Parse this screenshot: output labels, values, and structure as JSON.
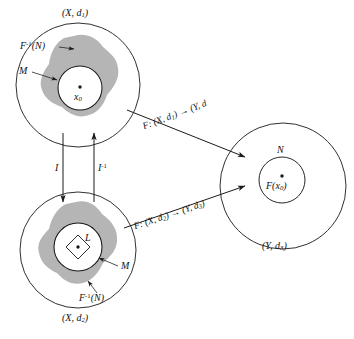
{
  "figure": {
    "colors": {
      "stroke": "#1a1a1a",
      "blob_fill": "#b5b5b5",
      "background": "#ffffff"
    }
  },
  "top_space": {
    "outer_label": "(X, d₁)",
    "outer_label_parts": {
      "base": "(X, d",
      "sub": "1",
      "close": ")"
    },
    "preimage_label": "F⁻¹(N)",
    "preimage_label_parts": {
      "base": "F",
      "sup": "-1",
      "close": "(N)"
    },
    "inner_set_label": "M",
    "point_label": "x₀",
    "point_label_parts": {
      "base": "x",
      "sub": "0"
    }
  },
  "bottom_space": {
    "outer_label": "(X, d₂)",
    "outer_label_parts": {
      "base": "(X, d",
      "sub": "2",
      "close": ")"
    },
    "preimage_label": "F⁻¹(N)",
    "preimage_label_parts": {
      "base": "F",
      "sup": "-1",
      "close": "(N)"
    },
    "inner_set_label": "M",
    "diamond_label": "L"
  },
  "target_space": {
    "outer_label": "(Y, d₃)",
    "outer_label_parts": {
      "base": "(Y, d",
      "sub": "3",
      "close": ")"
    },
    "inner_set_label": "N",
    "point_label": "F(x₀)",
    "point_label_parts": {
      "base": "F(x",
      "sub": "0",
      "close": ")"
    }
  },
  "maps": {
    "top_map": "F: (X, d₁) → (Y, d₃)",
    "top_map_parts": {
      "f": "F: (X, d",
      "sub1": "1",
      "mid": ") → (Y, d",
      "sub2": "3",
      "close": ")"
    },
    "bottom_map": "F: (X, d₂) → (Y, d₃)",
    "bottom_map_parts": {
      "f": "F: (X, d",
      "sub1": "2",
      "mid": ") → (Y, d",
      "sub2": "3",
      "close": ")"
    },
    "identity_down": "I",
    "identity_up": "I⁻¹",
    "identity_up_parts": {
      "base": "I",
      "sup": "-1"
    }
  }
}
